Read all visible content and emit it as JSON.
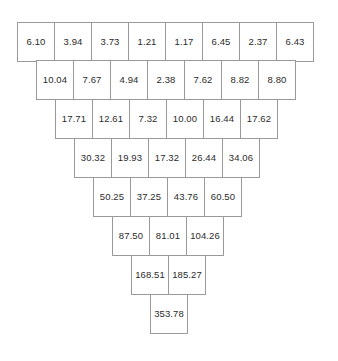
{
  "figure": {
    "name": "sum-pyramid",
    "background_color": "#ffffff",
    "border_color": "#9a9a9a",
    "text_color": "#2b2b2b",
    "cell_width_px": 38,
    "cell_height_px": 40,
    "origin_x_px": 17,
    "origin_y_px": 22,
    "row_offset_px": 19
  },
  "chart_data": {
    "type": "table",
    "title": "",
    "xlabel": "",
    "ylabel": "",
    "layout": "inverted-pyramid",
    "rows": [
      {
        "index": 0,
        "count": 8,
        "values": [
          "6.10",
          "3.94",
          "3.73",
          "1.21",
          "1.17",
          "6.45",
          "2.37",
          "6.43"
        ]
      },
      {
        "index": 1,
        "count": 7,
        "values": [
          "10.04",
          "7.67",
          "4.94",
          "2.38",
          "7.62",
          "8.82",
          "8.80"
        ]
      },
      {
        "index": 2,
        "count": 6,
        "values": [
          "17.71",
          "12.61",
          "7.32",
          "10.00",
          "16.44",
          "17.62"
        ]
      },
      {
        "index": 3,
        "count": 5,
        "values": [
          "30.32",
          "19.93",
          "17.32",
          "26.44",
          "34.06"
        ]
      },
      {
        "index": 4,
        "count": 4,
        "values": [
          "50.25",
          "37.25",
          "43.76",
          "60.50"
        ]
      },
      {
        "index": 5,
        "count": 3,
        "values": [
          "87.50",
          "81.01",
          "104.26"
        ]
      },
      {
        "index": 6,
        "count": 2,
        "values": [
          "168.51",
          "185.27"
        ]
      },
      {
        "index": 7,
        "count": 1,
        "values": [
          "353.78"
        ]
      }
    ]
  }
}
